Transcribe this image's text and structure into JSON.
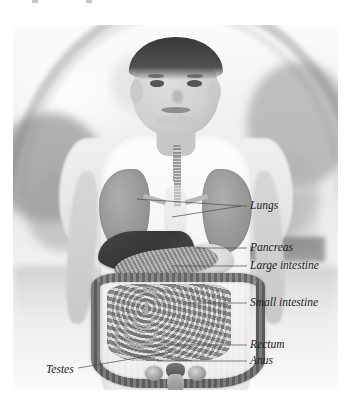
{
  "figure": {
    "type": "anatomy-photo-overlay",
    "style": "grayscale photograph",
    "background_scene": "outdoor park with blurred arch and trees"
  },
  "labels": [
    {
      "id": "lungs",
      "text": "Lungs",
      "x": 250,
      "y": 206,
      "leader": "double-converging-left"
    },
    {
      "id": "pancreas",
      "text": "Pancreas",
      "x": 250,
      "y": 248,
      "leader": "horizontal-left"
    },
    {
      "id": "large-intestine",
      "text": "Large intestine",
      "x": 250,
      "y": 266,
      "leader": "horizontal-left"
    },
    {
      "id": "small-intestine",
      "text": "Small intestine",
      "x": 250,
      "y": 303,
      "leader": "horizontal-left"
    },
    {
      "id": "rectum",
      "text": "Rectum",
      "x": 250,
      "y": 345,
      "leader": "horizontal-left"
    },
    {
      "id": "anus",
      "text": "Anus",
      "x": 250,
      "y": 361,
      "leader": "horizontal-left"
    },
    {
      "id": "testes",
      "text": "Testes",
      "x": 46,
      "y": 370,
      "leader": "diagonal-right-up"
    }
  ],
  "organs": [
    {
      "id": "lungs",
      "name": "Lungs"
    },
    {
      "id": "trachea",
      "name": "Trachea"
    },
    {
      "id": "spine",
      "name": "Spine"
    },
    {
      "id": "liver",
      "name": "Liver"
    },
    {
      "id": "stomach",
      "name": "Stomach"
    },
    {
      "id": "pancreas",
      "name": "Pancreas"
    },
    {
      "id": "large-intestine",
      "name": "Large intestine"
    },
    {
      "id": "small-intestine",
      "name": "Small intestine"
    },
    {
      "id": "rectum",
      "name": "Rectum"
    },
    {
      "id": "anus",
      "name": "Anus"
    },
    {
      "id": "testes",
      "name": "Testes"
    }
  ],
  "colors": {
    "label_text": "#1c1c1c",
    "leader_line": "#4a4a4a",
    "page_background": "#ffffff",
    "photo_tint": "#eaeaea"
  },
  "typography": {
    "label_font_size_px": 11.5,
    "label_style": "italic serif"
  }
}
